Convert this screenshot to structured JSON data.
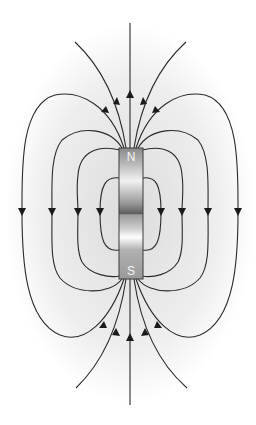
{
  "diagram": {
    "magnet": {
      "north_label": "N",
      "south_label": "S",
      "orientation": "vertical",
      "north_end": "top",
      "south_end": "bottom"
    },
    "field_lines": {
      "direction": "out of N pole (upward/outward), around the sides downward, into S pole",
      "closed_loops_per_side": 4,
      "open_lines_top": 5,
      "open_lines_bottom": 5
    },
    "colors": {
      "line": "#2a2a2a",
      "background_glow": "#e6e6e6",
      "magnet_light": "#d8d8d8",
      "magnet_dark": "#6e6e6e"
    }
  }
}
